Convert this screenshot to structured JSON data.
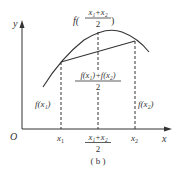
{
  "diagram": {
    "caption": "( b )",
    "axes": {
      "x_label": "x",
      "y_label": "y",
      "origin_label": "O"
    },
    "x_ticks": {
      "x1": {
        "base": "x",
        "sub": "1"
      },
      "mid": {
        "num": "x₁+x₂",
        "den": "2"
      },
      "x2": {
        "base": "x",
        "sub": "2"
      }
    },
    "labels": {
      "f_x1": "f(x₁)",
      "f_x2": "f(x₂)",
      "f_mid_prefix": "f(",
      "f_mid_num": "x₁+x₂",
      "f_mid_den": "2",
      "f_mid_suffix": ")",
      "avg_num": "f(x₁)+f(x₂)",
      "avg_den": "2"
    },
    "colors": {
      "stroke": "#333333",
      "background": "#ffffff"
    }
  }
}
